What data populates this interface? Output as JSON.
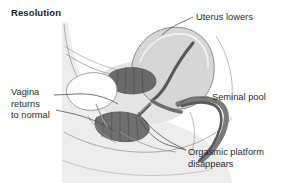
{
  "figure": {
    "title": "Resolution",
    "background_color": "#ffffff",
    "text_color": "#2a2a2a",
    "title_color": "#1b1b1b",
    "leader_line_color": "#4a4a4a",
    "illustration": {
      "name": "female-pelvis-sagittal-section",
      "body_fill": "#ededed",
      "body_outline": "#8a8a8a",
      "uterus_fill": "#d6d6d6",
      "uterus_outline": "#7c7c7c",
      "canal_dark": "#585858",
      "canal_mid": "#8e8e8e",
      "tissue_light": "#e4e4e4",
      "organ_white": "#fdfdfd"
    }
  },
  "labels": {
    "uterus": "Uterus lowers",
    "seminal_pool": "Seminal pool",
    "orgasmic_platform": "Orgasmic platform\ndisappears",
    "vagina": "Vagina\nreturns\nto normal"
  }
}
